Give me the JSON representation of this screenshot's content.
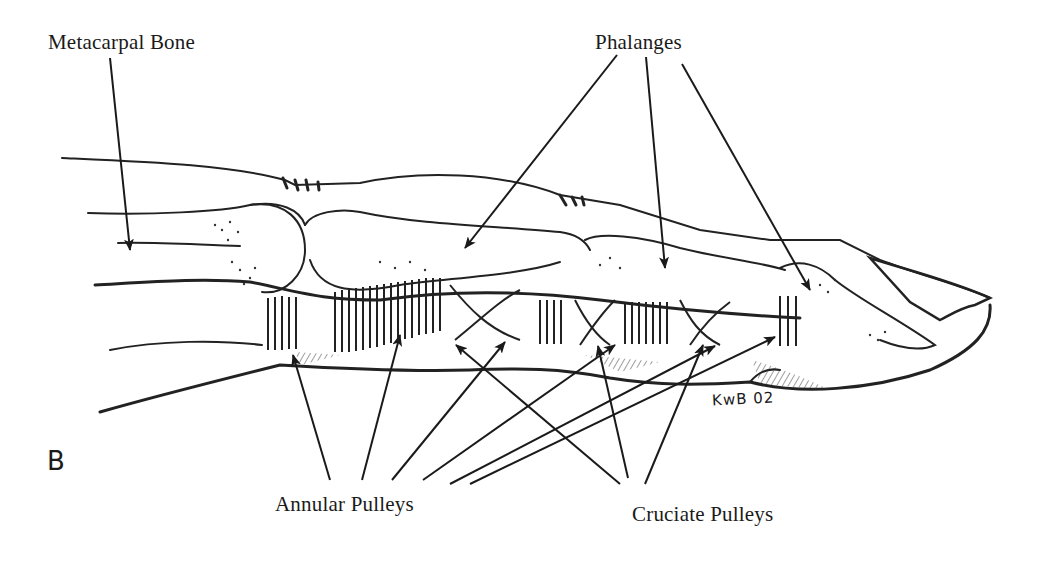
{
  "figure": {
    "panel_letter": "B",
    "signature": "KwB 02",
    "labels": {
      "metacarpal": "Metacarpal Bone",
      "phalanges": "Phalanges",
      "annular": "Annular Pulleys",
      "cruciate": "Cruciate Pulleys"
    },
    "colors": {
      "ink": "#1a1a1a",
      "background": "#ffffff"
    }
  }
}
